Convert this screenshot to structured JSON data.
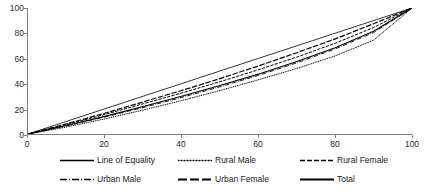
{
  "chart_data": {
    "type": "line",
    "title": "",
    "subtitle": "",
    "xlabel": "",
    "ylabel": "",
    "xlim": [
      0,
      100
    ],
    "ylim": [
      0,
      100
    ],
    "grid": false,
    "legend_position": "bottom",
    "x_ticks": [
      "0",
      "20",
      "40",
      "60",
      "80",
      "100"
    ],
    "y_ticks": [
      "0",
      "20",
      "40",
      "60",
      "80",
      "100"
    ],
    "x": [
      0,
      10,
      20,
      30,
      40,
      50,
      60,
      70,
      80,
      90,
      100
    ],
    "series": [
      {
        "name": "Line of Equality",
        "style": "solid",
        "values": [
          0,
          10,
          20,
          30,
          40,
          50,
          60,
          70,
          80,
          90,
          100
        ]
      },
      {
        "name": "Rural Male",
        "style": "dotted",
        "values": [
          0,
          5.5,
          12.0,
          19.0,
          26.5,
          34.5,
          43.0,
          52.0,
          62.0,
          74.5,
          100
        ]
      },
      {
        "name": "Rural Female",
        "style": "dashed",
        "values": [
          0,
          7.5,
          15.5,
          24.0,
          32.5,
          41.5,
          51.0,
          61.0,
          72.0,
          84.5,
          100
        ]
      },
      {
        "name": "Urban Male",
        "style": "dashdot",
        "values": [
          0,
          6.5,
          13.5,
          21.0,
          29.0,
          37.5,
          46.5,
          56.5,
          67.5,
          80.5,
          100
        ]
      },
      {
        "name": "Urban Female",
        "style": "longdash",
        "values": [
          0,
          8.0,
          16.5,
          25.5,
          34.5,
          44.0,
          54.0,
          64.5,
          75.5,
          87.5,
          100
        ]
      },
      {
        "name": "Total",
        "style": "solid-thick",
        "values": [
          0,
          6.8,
          14.0,
          21.8,
          30.0,
          38.5,
          47.5,
          57.5,
          68.5,
          81.5,
          100
        ]
      }
    ]
  },
  "legend": {
    "rows": [
      [
        {
          "label": "Line of Equality",
          "style": "solid"
        },
        {
          "label": "Rural Male",
          "style": "dotted"
        },
        {
          "label": "Rural Female",
          "style": "dashed"
        }
      ],
      [
        {
          "label": "Urban Male",
          "style": "dashdot"
        },
        {
          "label": "Urban Female",
          "style": "longdash"
        },
        {
          "label": "Total",
          "style": "solid-thick"
        }
      ]
    ]
  },
  "colors": {
    "line": "#000000",
    "axis": "#808080",
    "text": "#1a1a1a",
    "background": "#ffffff"
  }
}
